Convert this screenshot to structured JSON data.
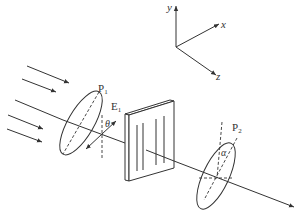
{
  "diagram": {
    "type": "optics-polarization-setup",
    "axes": {
      "x_label": "x",
      "y_label": "y",
      "z_label": "z"
    },
    "polarizer_1": {
      "label": "P",
      "subscript": "1"
    },
    "field_vector": {
      "label": "E",
      "subscript": "1",
      "angle_label": "θ"
    },
    "polarizer_2": {
      "label": "P",
      "subscript": "2",
      "angle_label": "α"
    },
    "sample": {
      "name": "plate with vertical lines"
    },
    "incoming_rays": 5
  },
  "colors": {
    "line": "#333333",
    "background": "#ffffff"
  }
}
